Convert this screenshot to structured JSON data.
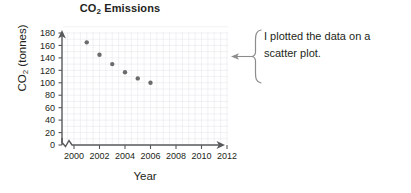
{
  "chart_data": {
    "type": "scatter",
    "title": "CO2 Emissions",
    "title_main": "CO",
    "title_sub": "2",
    "title_rest": " Emissions",
    "xlabel": "Year",
    "ylabel": "CO2 (tonnes)",
    "ylabel_main": "CO",
    "ylabel_sub": "2",
    "ylabel_rest": " (tonnes)",
    "x": [
      2001,
      2002,
      2003,
      2004,
      2005,
      2006
    ],
    "values": [
      165,
      145,
      130,
      117,
      107,
      100
    ],
    "points": [
      {
        "x": 2001,
        "y": 165
      },
      {
        "x": 2002,
        "y": 145
      },
      {
        "x": 2003,
        "y": 130
      },
      {
        "x": 2004,
        "y": 117
      },
      {
        "x": 2005,
        "y": 107
      },
      {
        "x": 2006,
        "y": 100
      }
    ],
    "xticks": [
      2000,
      2002,
      2004,
      2006,
      2008,
      2010,
      2012
    ],
    "xtick_labels": [
      "2000",
      "2002",
      "2004",
      "2006",
      "2008",
      "2010",
      "2012"
    ],
    "yticks": [
      0,
      20,
      40,
      60,
      80,
      100,
      120,
      140,
      160,
      180
    ],
    "ytick_labels": [
      "0",
      "20",
      "40",
      "60",
      "80",
      "100",
      "120",
      "140",
      "160",
      "180"
    ],
    "xlim": [
      1999,
      2013
    ],
    "ylim": [
      0,
      190
    ],
    "grid": true,
    "axis_break_x": true,
    "legend": null,
    "marker_color": "#6b6b6b",
    "axis_color": "#58595b",
    "grid_color": "#e8e8ec"
  },
  "annotation": {
    "line1": "I plotted the data on a",
    "line2": "scatter plot.",
    "brace": "curly-brace",
    "arrow_direction": "left"
  },
  "colors": {
    "text": "#231f20",
    "background": "#ffffff",
    "marker": "#6b6b6b",
    "axis": "#58595b",
    "grid": "#e8e8ec",
    "annotation_line": "#8c8c8c"
  }
}
